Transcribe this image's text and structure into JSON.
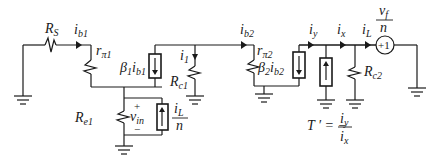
{
  "diagram": {
    "type": "small-signal feedback amplifier circuit",
    "labels": {
      "Rs": {
        "main": "R",
        "sub": "S"
      },
      "ib1": {
        "main": "i",
        "sub": "b1"
      },
      "rpi1": {
        "main": "r",
        "sub": "π1"
      },
      "beta1": {
        "main": "β",
        "sub1": "1",
        "main2": "i",
        "sub2": "b1"
      },
      "i1": {
        "main": "i",
        "sub": "1"
      },
      "Rc1": {
        "main": "R",
        "sub": "c1"
      },
      "Re1": {
        "main": "R",
        "sub": "e1"
      },
      "vin": {
        "main": "v",
        "sub": "in",
        "plus": "+",
        "minus": "−"
      },
      "iL_over_n": {
        "num_main": "i",
        "num_sub": "L",
        "den": "n"
      },
      "ib2": {
        "main": "i",
        "sub": "b2"
      },
      "rpi2": {
        "main": "r",
        "sub": "π2"
      },
      "beta2": {
        "main": "β",
        "sub1": "2",
        "main2": "i",
        "sub2": "b2"
      },
      "iy": {
        "main": "i",
        "sub": "y"
      },
      "ix": {
        "main": "i",
        "sub": "x"
      },
      "iL": {
        "main": "i",
        "sub": "L"
      },
      "Rc2": {
        "main": "R",
        "sub": "c2"
      },
      "vf_over_n": {
        "num_main": "v",
        "num_sub": "f",
        "den": "n"
      },
      "source_sign": "+1",
      "loop_gain": {
        "lhs": "T ′ = −",
        "num_main": "i",
        "num_sub": "y",
        "den_main": "i",
        "den_sub": "x"
      }
    }
  }
}
